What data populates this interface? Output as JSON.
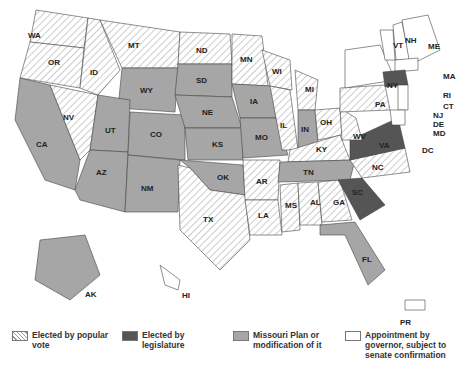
{
  "legend": [
    {
      "label": "Elected by popular vote",
      "style": "hatch"
    },
    {
      "label": "Elected by legislature",
      "color": "#555555"
    },
    {
      "label": "Missouri Plan or modification of it",
      "color": "#a6a6a6"
    },
    {
      "label": "Appointment by governor, subject to senate confirmation",
      "color": "#ffffff"
    }
  ],
  "labels": {
    "WA": "WA",
    "OR": "OR",
    "CA": "CA",
    "NV": "NV",
    "ID": "ID",
    "MT": "MT",
    "WY": "WY",
    "UT": "UT",
    "AZ": "AZ",
    "CO": "CO",
    "NM": "NM",
    "ND": "ND",
    "SD": "SD",
    "NE": "NE",
    "KS": "KS",
    "OK": "OK",
    "TX": "TX",
    "MN": "MN",
    "IA": "IA",
    "MO": "MO",
    "AR": "AR",
    "LA": "LA",
    "WI": "WI",
    "IL": "IL",
    "MI": "MI",
    "IN": "IN",
    "OH": "OH",
    "KY": "KY",
    "TN": "TN",
    "MS": "MS",
    "AL": "AL",
    "GA": "GA",
    "FL": "FL",
    "SC": "SC",
    "NC": "NC",
    "VA": "VA",
    "WV": "WV",
    "PA": "PA",
    "NY": "NY",
    "VT": "VT",
    "NH": "NH",
    "ME": "ME",
    "MA": "MA",
    "RI": "RI",
    "CT": "CT",
    "NJ": "NJ",
    "DE": "DE",
    "MD": "MD",
    "DC": "DC",
    "AK": "AK",
    "HI": "HI",
    "PR": "PR"
  }
}
